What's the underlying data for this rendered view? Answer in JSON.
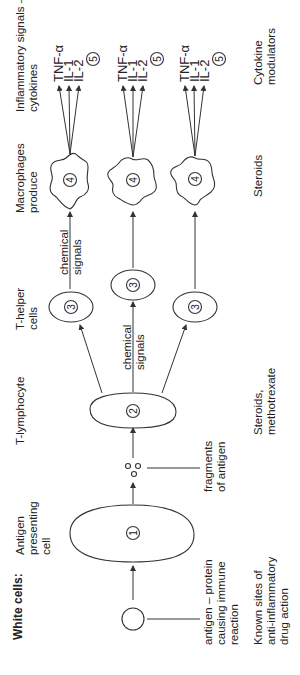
{
  "diagram": {
    "orientation": "rotated-90-ccw",
    "header": {
      "row_label": "White cells:",
      "stages": [
        "Antigen presenting cell",
        "T-lymphocyte",
        "T-helper cells",
        "Macrophages produce",
        "Inflammatory signals – cytokines"
      ]
    },
    "annotations": {
      "antigen": "antigen – protein causing immune reaction",
      "fragments": "fragments of antigen",
      "chemical_signals_1": "chemical signals",
      "chemical_signals_2": "chemical signals"
    },
    "drug_row": {
      "label": "Known sites of anti-inflammatory drug action",
      "sites": [
        "Steroids, methotrexate",
        "Steroids",
        "Cytokine modulators"
      ]
    },
    "cell_numbers": {
      "apc": "1",
      "t_lymphocyte": "2",
      "t_helper": "3",
      "macrophage": "4",
      "cytokines": "5"
    },
    "cytokines": [
      "TNF-α",
      "IL-1",
      "IL-2"
    ]
  }
}
